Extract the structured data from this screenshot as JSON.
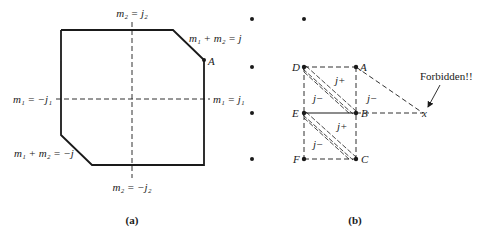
{
  "panel_a": {
    "caption": "(a)",
    "labels": {
      "top_axis": "m₂ = j₂",
      "bottom_axis": "m₂ = −j₂",
      "left_axis": "m₁ = −j₁",
      "right_axis": "m₁ = j₁",
      "upper_diagonal": "m₁ + m₂ = j",
      "lower_diagonal": "m₁ + m₂ = −j",
      "point_A": "A"
    }
  },
  "panel_b": {
    "caption": "(b)",
    "points": {
      "A": "A",
      "B": "B",
      "C": "C",
      "D": "D",
      "E": "E",
      "F": "F",
      "x": "x"
    },
    "region_labels": {
      "DAB_upper": "j+",
      "DEB_lower": "j−",
      "AB_right": "j−",
      "EBC_upper": "j+",
      "EFC_lower": "j−"
    },
    "annotation": "Forbidden!!"
  }
}
